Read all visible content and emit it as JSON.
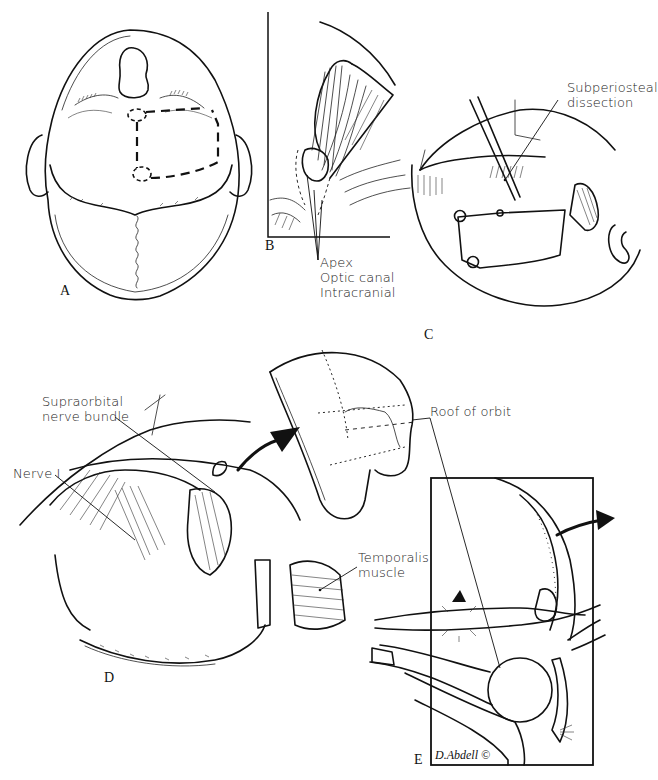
{
  "figure": {
    "panels": [
      {
        "id": "A",
        "label": "A",
        "content": "Top-down view of head with dashed craniotomy outline and burr holes"
      },
      {
        "id": "B",
        "label": "B",
        "content": "Orbital contents viewed from above with callouts to the apex",
        "callouts": [
          "Apex",
          "Optic canal",
          "Intracranial"
        ]
      },
      {
        "id": "C",
        "label": "C",
        "content": "Scalp flap reflected, instrument performing dissection",
        "callouts": [
          "Subperiosteal dissection"
        ]
      },
      {
        "id": "D",
        "label": "D",
        "content": "Exposed frontal lobe with bone flap removed",
        "callouts": [
          "Supraorbital nerve bundle",
          "Nerve I",
          "Temporalis muscle"
        ]
      },
      {
        "id": "E",
        "label": "E",
        "content": "Sagittal cross-section of the orbit and frontal bone",
        "callouts": [
          "Roof of orbit"
        ]
      }
    ],
    "labels": {
      "apex": "Apex",
      "optic_canal": "Optic canal",
      "intracranial": "Intracranial",
      "subperiosteal_1": "Subperiosteal",
      "subperiosteal_2": "dissection",
      "supraorbital_1": "Supraorbital",
      "supraorbital_2": "nerve bundle",
      "nerve_1": "Nerve I",
      "roof_of_orbit": "Roof of orbit",
      "temporalis_1": "Temporalis",
      "temporalis_2": "muscle"
    },
    "panel_letters": {
      "a": "A",
      "b": "B",
      "c": "C",
      "d": "D",
      "e": "E"
    },
    "signature": "D.Abdell ©",
    "colors": {
      "ink": "#111111",
      "background": "#ffffff"
    }
  }
}
